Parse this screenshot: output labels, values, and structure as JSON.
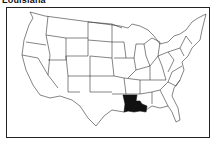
{
  "title": "Louisiana",
  "map": {
    "highlighted_state": "Louisiana",
    "highlight_color": "#111111",
    "outline_color": "#222222",
    "background": "#ffffff"
  }
}
